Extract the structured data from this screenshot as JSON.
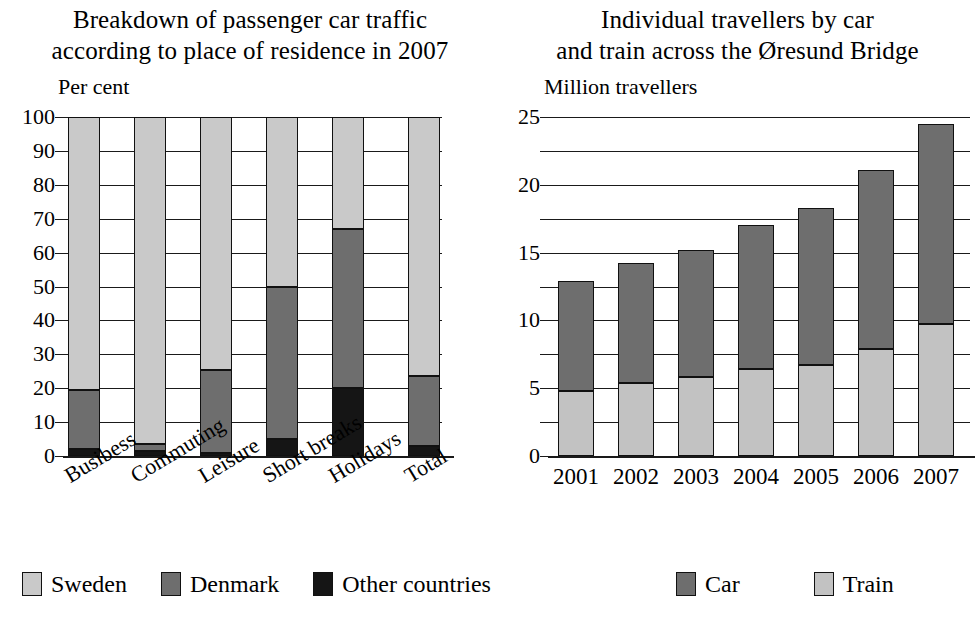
{
  "left": {
    "title_lines": [
      "Breakdown of passenger car traffic",
      "according to place of residence in 2007"
    ],
    "axis_unit": "Per cent",
    "legend": [
      {
        "key": "sweden",
        "label": "Sweden",
        "color": "#c9c9c9"
      },
      {
        "key": "denmark",
        "label": "Denmark",
        "color": "#6e6e6e"
      },
      {
        "key": "other",
        "label": "Other countries",
        "color": "#151515"
      }
    ],
    "chart_data": {
      "type": "bar",
      "title": "Breakdown of passenger car traffic according to place of residence in 2007",
      "subtype": "stacked-100",
      "xlabel": "",
      "ylabel": "Per cent",
      "ylim": [
        0,
        100
      ],
      "yticks": [
        0,
        10,
        20,
        30,
        40,
        50,
        60,
        70,
        80,
        90,
        100
      ],
      "ytick_labels": [
        "0",
        "10",
        "20",
        "30",
        "40",
        "50",
        "60",
        "70",
        "80",
        "90",
        "100"
      ],
      "grid": true,
      "legend_position": "bottom-left",
      "categories": [
        "Busibess",
        "Commuting",
        "Leisure",
        "Short breaks",
        "Holidays",
        "Total"
      ],
      "series": [
        {
          "name": "Other countries",
          "values": [
            2,
            1.5,
            1,
            5,
            20,
            3
          ]
        },
        {
          "name": "Denmark",
          "values": [
            17.5,
            2,
            24.5,
            45,
            47,
            20.5
          ]
        },
        {
          "name": "Sweden",
          "values": [
            80.5,
            96.5,
            74.5,
            50,
            33,
            76.5
          ]
        }
      ],
      "cumulative_tops": {
        "Other countries": [
          2,
          1.5,
          1,
          5,
          20,
          3
        ],
        "Denmark": [
          19.5,
          3.5,
          25.5,
          50,
          67,
          23.5
        ],
        "Sweden": [
          100,
          100,
          100,
          100,
          100,
          100
        ]
      }
    }
  },
  "right": {
    "title_lines": [
      "Individual travellers by car",
      "and train across the Øresund Bridge"
    ],
    "axis_unit": "Million travellers",
    "legend": [
      {
        "key": "car",
        "label": "Car",
        "color": "#6e6e6e"
      },
      {
        "key": "train",
        "label": "Train",
        "color": "#c2c2c2"
      }
    ],
    "chart_data": {
      "type": "bar",
      "title": "Individual travellers by car and train across the Øresund Bridge",
      "subtype": "stacked",
      "xlabel": "",
      "ylabel": "Million travellers",
      "ylim": [
        0,
        25
      ],
      "yticks": [
        0,
        5,
        10,
        15,
        20,
        25
      ],
      "ytick_labels": [
        "0",
        "5",
        "10",
        "15",
        "20",
        "25"
      ],
      "minor_tick_step": 2.5,
      "grid": true,
      "legend_position": "bottom-center",
      "categories": [
        "2001",
        "2002",
        "2003",
        "2004",
        "2005",
        "2006",
        "2007"
      ],
      "series": [
        {
          "name": "Train",
          "values": [
            4.8,
            5.4,
            5.8,
            6.4,
            6.7,
            7.9,
            9.7
          ]
        },
        {
          "name": "Car",
          "values": [
            8.1,
            8.8,
            9.4,
            10.6,
            11.6,
            13.2,
            14.8
          ]
        }
      ],
      "totals": [
        12.9,
        14.2,
        15.2,
        17.0,
        18.3,
        21.1,
        24.5
      ]
    }
  }
}
